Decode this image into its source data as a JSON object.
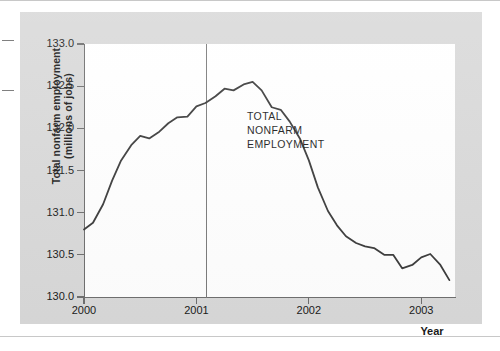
{
  "figure": {
    "panel_background": "#d9d9d9",
    "plot_background": "#ffffff"
  },
  "axes": {
    "y_title_line1": "Total nonfarm employment",
    "y_title_line2": "(millions of jobs)",
    "x_title": "Year",
    "y_ticks": [
      "130.0",
      "130.5",
      "131.0",
      "131.5",
      "132.0",
      "132.5",
      "133.0"
    ],
    "x_ticks": [
      "2000",
      "2001",
      "2002",
      "2003"
    ]
  },
  "annotation": {
    "line1": "TOTAL",
    "line2": "NONFARM",
    "line3": "EMPLOYMENT"
  },
  "chart_data": {
    "type": "line",
    "title": "",
    "xlabel": "Year",
    "ylabel": "Total nonfarm employment (millions of jobs)",
    "xlim": [
      2000.0,
      2003.3
    ],
    "ylim": [
      130.0,
      133.0
    ],
    "ytick_values": [
      130.0,
      130.5,
      131.0,
      131.5,
      132.0,
      132.5,
      133.0
    ],
    "xtick_values": [
      2000,
      2001,
      2002,
      2003
    ],
    "grid": false,
    "legend": null,
    "line_color": "#3a3a3a",
    "annotations": [
      {
        "text": "TOTAL NONFARM EMPLOYMENT",
        "x": 2001.45,
        "y": 132.15
      },
      {
        "type": "vertical-line",
        "label": "business cycle peak",
        "x": 2001.09,
        "color": "#7a7a7a"
      }
    ],
    "series": [
      {
        "name": "Total nonfarm employment",
        "x": [
          2000.0,
          2000.08,
          2000.17,
          2000.25,
          2000.33,
          2000.42,
          2000.5,
          2000.58,
          2000.67,
          2000.75,
          2000.83,
          2000.92,
          2001.0,
          2001.08,
          2001.17,
          2001.25,
          2001.33,
          2001.42,
          2001.5,
          2001.58,
          2001.67,
          2001.75,
          2001.83,
          2001.92,
          2002.0,
          2002.08,
          2002.17,
          2002.25,
          2002.33,
          2002.42,
          2002.5,
          2002.58,
          2002.67,
          2002.75,
          2002.83,
          2002.92,
          2003.0,
          2003.08,
          2003.17,
          2003.25
        ],
        "y": [
          130.8,
          130.88,
          131.1,
          131.38,
          131.62,
          131.8,
          131.91,
          131.88,
          131.96,
          132.06,
          132.13,
          132.14,
          132.26,
          132.3,
          132.38,
          132.47,
          132.45,
          132.52,
          132.55,
          132.45,
          132.25,
          132.22,
          132.08,
          131.88,
          131.62,
          131.3,
          131.02,
          130.85,
          130.72,
          130.64,
          130.6,
          130.58,
          130.5,
          130.5,
          130.34,
          130.38,
          130.47,
          130.51,
          130.38,
          130.2
        ]
      }
    ]
  }
}
